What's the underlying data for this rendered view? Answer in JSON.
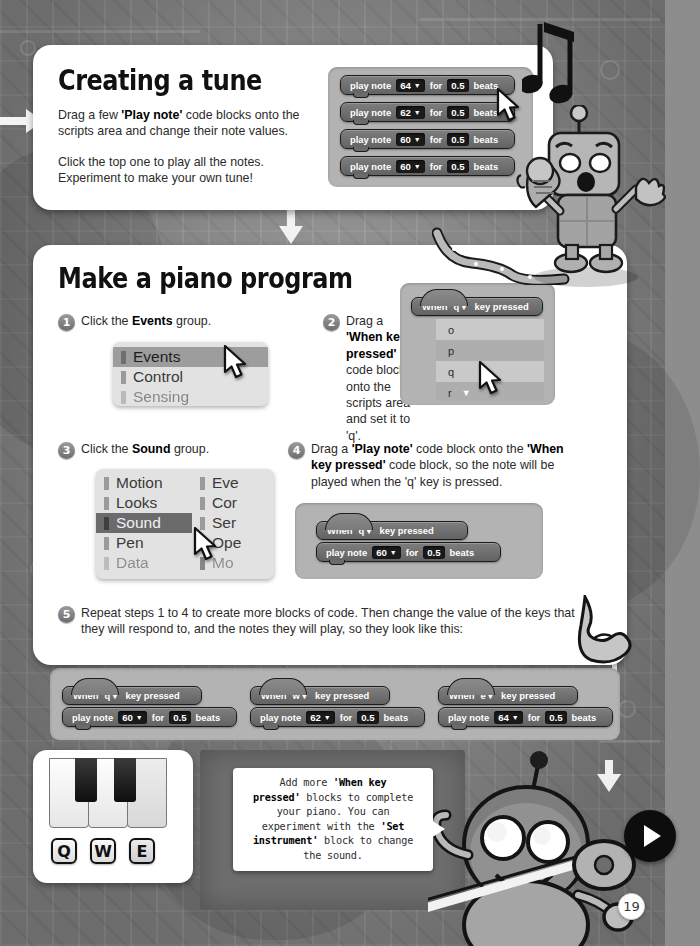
{
  "page": {
    "number": "19",
    "next_button": "next-page"
  },
  "section1": {
    "title": "Creating a tune",
    "para1_pre": "Drag a few ",
    "para1_bold": "'Play note'",
    "para1_post": " code blocks onto the scripts area and change their note values.",
    "para2": "Click the top one to play all the notes. Experiment to make your own tune!",
    "blocks": [
      {
        "label": "play note",
        "note": "64",
        "for": "for",
        "beats": "0.5",
        "beats_label": "beats"
      },
      {
        "label": "play note",
        "note": "62",
        "for": "for",
        "beats": "0.5",
        "beats_label": "beats"
      },
      {
        "label": "play note",
        "note": "60",
        "for": "for",
        "beats": "0.5",
        "beats_label": "beats"
      },
      {
        "label": "play note",
        "note": "60",
        "for": "for",
        "beats": "0.5",
        "beats_label": "beats"
      }
    ]
  },
  "section2": {
    "title": "Make a piano program",
    "step1": {
      "num": "1",
      "text_pre": "Click the ",
      "text_bold": "Events",
      "text_post": " group.",
      "categories": [
        {
          "label": "Events",
          "state": "selected"
        },
        {
          "label": "Control",
          "state": "normal"
        },
        {
          "label": "Sensing",
          "state": "normal"
        }
      ]
    },
    "step2": {
      "num": "2",
      "text_pre": "Drag a ",
      "text_bold": "'When key pressed'",
      "text_post": " code block onto the scripts area and set it to 'q'.",
      "hat_block": {
        "when": "When",
        "key": "q",
        "tail": "key pressed"
      },
      "dropdown_options": [
        "o",
        "p",
        "q",
        "r"
      ]
    },
    "step3": {
      "num": "3",
      "text_pre": "Click the ",
      "text_bold": "Sound",
      "text_post": " group.",
      "categories_left": [
        {
          "label": "Motion",
          "state": "normal"
        },
        {
          "label": "Looks",
          "state": "normal"
        },
        {
          "label": "Sound",
          "state": "dark"
        },
        {
          "label": "Pen",
          "state": "normal"
        },
        {
          "label": "Data",
          "state": "normal"
        }
      ],
      "categories_right": [
        {
          "label": "Eve",
          "state": "normal"
        },
        {
          "label": "Cor",
          "state": "normal"
        },
        {
          "label": "Ser",
          "state": "normal"
        },
        {
          "label": "Ope",
          "state": "normal"
        },
        {
          "label": "Mo",
          "state": "normal"
        }
      ]
    },
    "step4": {
      "num": "4",
      "text_pre": "Drag a ",
      "text_bold1": "'Play note'",
      "text_mid": " code block onto the ",
      "text_bold2": "'When key pressed'",
      "text_post": " code block, so the note will be played when the 'q' key is pressed.",
      "script": {
        "hat": {
          "when": "When",
          "key": "q",
          "tail": "key pressed"
        },
        "block": {
          "label": "play note",
          "note": "60",
          "for": "for",
          "beats": "0.5",
          "beats_label": "beats"
        }
      }
    },
    "step5": {
      "num": "5",
      "text": "Repeat steps 1 to 4 to create more blocks of code. Then change the value of the keys that they will respond to, and the notes they will play, so they look like this:",
      "scripts": [
        {
          "hat": {
            "when": "When",
            "key": "q",
            "tail": "key pressed"
          },
          "block": {
            "label": "play note",
            "note": "60",
            "for": "for",
            "beats": "0.5",
            "beats_label": "beats"
          }
        },
        {
          "hat": {
            "when": "When",
            "key": "w",
            "tail": "key pressed"
          },
          "block": {
            "label": "play note",
            "note": "62",
            "for": "for",
            "beats": "0.5",
            "beats_label": "beats"
          }
        },
        {
          "hat": {
            "when": "When",
            "key": "e",
            "tail": "key pressed"
          },
          "block": {
            "label": "play note",
            "note": "64",
            "for": "for",
            "beats": "0.5",
            "beats_label": "beats"
          }
        }
      ]
    }
  },
  "piano": {
    "keycaps": [
      "Q",
      "W",
      "E"
    ]
  },
  "bubble": {
    "line1_a": "Add more ",
    "line1_b": "'When key",
    "line2_b": "pressed'",
    "line2_a": " blocks to complete",
    "line3": "your piano. You can",
    "line4_a": "experiment with the ",
    "line4_b": "'Set",
    "line5_b": "instrument'",
    "line5_a": " block to change",
    "line6": "the sound."
  },
  "colors": {
    "background": "#8b8b8b",
    "panel": "#ffffff",
    "block_fill": "#6f6f6f",
    "block_value": "#1a1a1a",
    "script_area": "#b3b3b3",
    "selected_category": "#6b6b6b"
  }
}
